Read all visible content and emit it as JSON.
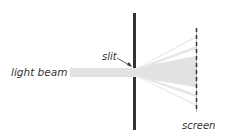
{
  "diagram": {
    "labels": {
      "light_beam": "light beam",
      "slit": "slit",
      "screen": "screen"
    },
    "colors": {
      "beam": "#e2e2e2",
      "barrier": "#333333",
      "screen": "#333333",
      "text": "#333333"
    }
  }
}
